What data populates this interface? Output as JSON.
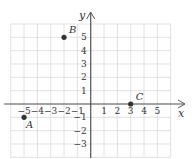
{
  "graph": {
    "x_axis_label": "x",
    "y_axis_label": "y",
    "x_range": [
      -6,
      6
    ],
    "y_range": [
      -4,
      6
    ],
    "x_tick_labels": [
      "-5",
      "-4",
      "-3",
      "-2",
      "-1",
      "1",
      "2",
      "3",
      "4",
      "5"
    ],
    "y_tick_labels": [
      "5",
      "4",
      "3",
      "2",
      "1",
      "-1",
      "-2",
      "-3"
    ],
    "colors": {
      "grid": "#d6d6d6",
      "axis": "#555555",
      "point": "#333333"
    }
  },
  "points": [
    {
      "label": "A",
      "x": -5,
      "y": -1
    },
    {
      "label": "B",
      "x": -2,
      "y": 5
    },
    {
      "label": "C",
      "x": 3,
      "y": 0
    }
  ]
}
